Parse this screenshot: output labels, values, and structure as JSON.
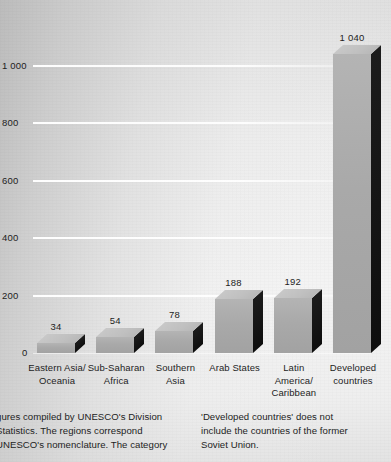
{
  "chart_data": {
    "type": "bar",
    "title": "",
    "subtitle": "",
    "xlabel": "",
    "ylabel": "",
    "ylim": [
      0,
      1100
    ],
    "grid": true,
    "legend": "none",
    "categories": [
      "Eastern Asia/\nOceania",
      "Sub-Saharan\nAfrica",
      "Southern\nAsia",
      "Arab States",
      "Latin America/\nCaribbean",
      "Developed\ncountries"
    ],
    "values": [
      34,
      54,
      78,
      188,
      192,
      1040
    ],
    "value_labels": [
      "34",
      "54",
      "78",
      "188",
      "192",
      "1 040"
    ],
    "y_ticks": [
      0,
      200,
      400,
      600,
      800,
      1000
    ],
    "y_tick_labels": [
      "0",
      "200",
      "400",
      "600",
      "800",
      "1 000"
    ],
    "colors": {
      "bar_front": "#a9a9a9",
      "bar_side": "#141414",
      "bar_top": "#c2c2c2",
      "gridline": "#ffffff",
      "background": "#d8d8d8",
      "text": "#1d1d1d"
    }
  },
  "notes": {
    "left": "gures compiled by UNESCO's Division\nStatistics. The regions correspond\nUNESCO's nomenclature. The category",
    "right": "'Developed countries' does not\ninclude the countries of the former\nSoviet Union."
  }
}
